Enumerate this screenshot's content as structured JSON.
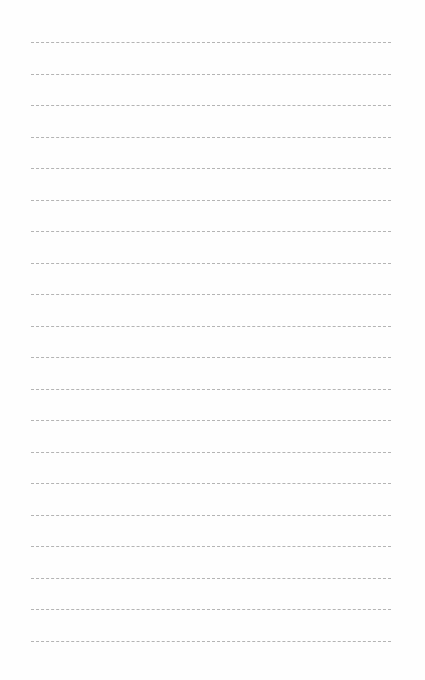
{
  "page": {
    "background": "#fefefe",
    "rule_color": "#b4b4b4",
    "rule_style": "dashed",
    "rule_count": 20,
    "rule_start_y": 42,
    "rule_spacing": 31.5,
    "rule_left_x": 31,
    "rule_width": 360
  }
}
